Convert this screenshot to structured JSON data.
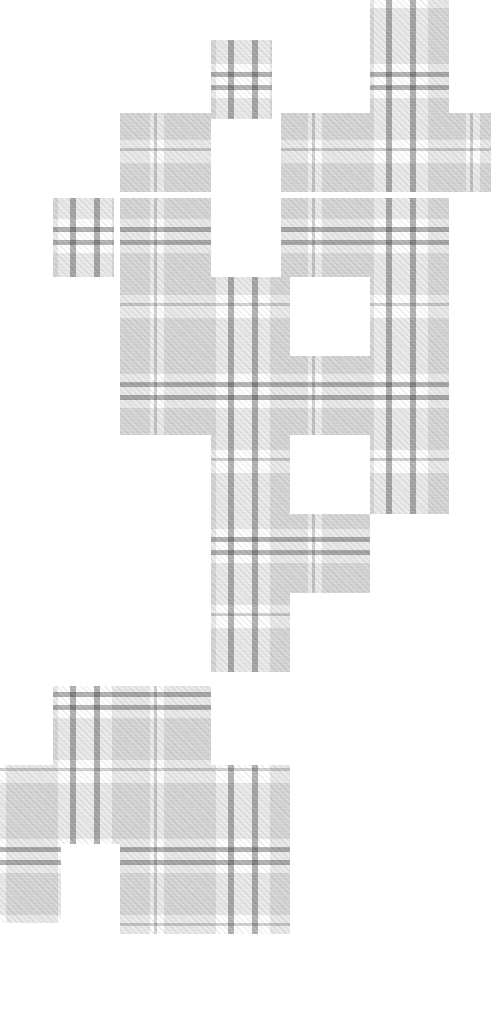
{
  "artwork": {
    "title": "Tartan Swatch Mosaic",
    "subject": "plaid-fabric",
    "canvas": {
      "width": 491,
      "height": 1027
    },
    "background_color": "#ffffff"
  },
  "palette": {
    "paper_white": "#ffffff",
    "band_light": "#e9e9e9",
    "band_mid": "#d0d0d0",
    "rule_dark": "#6a6a6a",
    "twill_line": "#efefef",
    "accent": "#5a5a5a"
  },
  "pattern": {
    "name": "tartan-sett",
    "weave": "twill-45",
    "repeat_x": 158,
    "repeat_y": 155,
    "warp_stripes": [
      {
        "offset": 6,
        "width": 52,
        "tone": "band_light"
      },
      {
        "offset": 70,
        "width": 6,
        "tone": "rule_dark"
      },
      {
        "offset": 94,
        "width": 6,
        "tone": "rule_dark"
      },
      {
        "offset": 112,
        "width": 38,
        "tone": "band_light"
      },
      {
        "offset": 154,
        "width": 3,
        "tone": "band_mid"
      }
    ],
    "weft_stripes": [
      {
        "offset": 8,
        "width": 56,
        "tone": "band_light"
      },
      {
        "offset": 72,
        "width": 5,
        "tone": "rule_dark"
      },
      {
        "offset": 85,
        "width": 5,
        "tone": "rule_dark"
      },
      {
        "offset": 98,
        "width": 42,
        "tone": "band_light"
      },
      {
        "offset": 148,
        "width": 3,
        "tone": "band_mid"
      }
    ]
  },
  "mosaic": {
    "tile_width": 79,
    "tile_height": 79,
    "description": "Descending staircase of square windows revealing one continuous tartan plane.",
    "tiles": [
      {
        "id": "t01",
        "x": 370,
        "y": 0,
        "w": 79,
        "h": 40
      },
      {
        "id": "t02",
        "x": 211,
        "y": 40,
        "w": 61,
        "h": 79
      },
      {
        "id": "t03",
        "x": 370,
        "y": 40,
        "w": 79,
        "h": 79
      },
      {
        "id": "t04",
        "x": 120,
        "y": 113,
        "w": 91,
        "h": 79
      },
      {
        "id": "t05",
        "x": 281,
        "y": 113,
        "w": 89,
        "h": 79
      },
      {
        "id": "t06",
        "x": 370,
        "y": 113,
        "w": 121,
        "h": 79
      },
      {
        "id": "t07",
        "x": 53,
        "y": 198,
        "w": 61,
        "h": 79
      },
      {
        "id": "t08",
        "x": 120,
        "y": 198,
        "w": 91,
        "h": 79
      },
      {
        "id": "t09",
        "x": 281,
        "y": 198,
        "w": 89,
        "h": 79
      },
      {
        "id": "t10",
        "x": 370,
        "y": 198,
        "w": 79,
        "h": 79
      },
      {
        "id": "t11",
        "x": 120,
        "y": 277,
        "w": 91,
        "h": 79
      },
      {
        "id": "t12",
        "x": 211,
        "y": 277,
        "w": 79,
        "h": 79
      },
      {
        "id": "t13",
        "x": 370,
        "y": 277,
        "w": 79,
        "h": 79
      },
      {
        "id": "t14",
        "x": 120,
        "y": 356,
        "w": 91,
        "h": 79
      },
      {
        "id": "t15",
        "x": 211,
        "y": 356,
        "w": 79,
        "h": 79
      },
      {
        "id": "t16",
        "x": 281,
        "y": 356,
        "w": 89,
        "h": 79
      },
      {
        "id": "t17",
        "x": 370,
        "y": 356,
        "w": 79,
        "h": 79
      },
      {
        "id": "t18",
        "x": 211,
        "y": 435,
        "w": 79,
        "h": 79
      },
      {
        "id": "t19",
        "x": 370,
        "y": 435,
        "w": 79,
        "h": 79
      },
      {
        "id": "t20",
        "x": 211,
        "y": 514,
        "w": 79,
        "h": 79
      },
      {
        "id": "t21",
        "x": 281,
        "y": 514,
        "w": 89,
        "h": 79
      },
      {
        "id": "t22",
        "x": 211,
        "y": 593,
        "w": 79,
        "h": 79
      },
      {
        "id": "t23",
        "x": 53,
        "y": 686,
        "w": 79,
        "h": 79
      },
      {
        "id": "t24",
        "x": 120,
        "y": 686,
        "w": 91,
        "h": 79
      },
      {
        "id": "t25",
        "x": 0,
        "y": 765,
        "w": 61,
        "h": 79
      },
      {
        "id": "t26",
        "x": 53,
        "y": 765,
        "w": 79,
        "h": 79
      },
      {
        "id": "t27",
        "x": 120,
        "y": 765,
        "w": 91,
        "h": 79
      },
      {
        "id": "t28",
        "x": 211,
        "y": 765,
        "w": 79,
        "h": 79
      },
      {
        "id": "t29",
        "x": 0,
        "y": 844,
        "w": 61,
        "h": 79
      },
      {
        "id": "t30",
        "x": 120,
        "y": 844,
        "w": 91,
        "h": 90
      },
      {
        "id": "t31",
        "x": 211,
        "y": 844,
        "w": 79,
        "h": 90
      }
    ]
  }
}
